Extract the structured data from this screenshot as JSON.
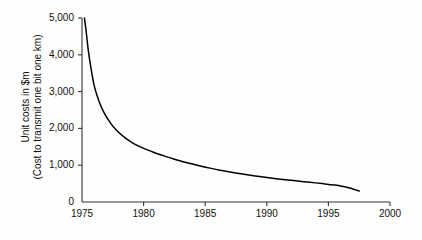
{
  "chart_data": {
    "type": "line",
    "title": "",
    "subtitle": "",
    "xlabel": "",
    "ylabel_lines": [
      "Unit costs in $m",
      "(Cost to transmit one bit one km)"
    ],
    "xlim": [
      1975,
      2000
    ],
    "ylim": [
      0,
      5000
    ],
    "xticks": [
      1975,
      1980,
      1985,
      1990,
      1995,
      2000
    ],
    "xtick_labels": [
      "1975",
      "1980",
      "1985",
      "1990",
      "1995",
      "2000"
    ],
    "yticks": [
      0,
      1000,
      2000,
      3000,
      4000,
      5000
    ],
    "ytick_labels": [
      "0",
      "1,000",
      "2,000",
      "3,000",
      "4,000",
      "5,000"
    ],
    "grid": false,
    "legend": false,
    "line_color": "#000000",
    "axis_color": "#333333",
    "background_color": "#fefefe",
    "series": [
      {
        "name": "Unit cost to transmit one bit one km",
        "x": [
          1975.2,
          1975.35,
          1975.5,
          1975.7,
          1976.0,
          1976.4,
          1976.8,
          1977.3,
          1977.8,
          1978.4,
          1979.0,
          1979.6,
          1980.2,
          1980.9,
          1981.6,
          1982.3,
          1983.0,
          1983.8,
          1984.6,
          1985.4,
          1986.2,
          1987.0,
          1987.9,
          1988.8,
          1989.7,
          1990.6,
          1991.5,
          1992.5,
          1993.5,
          1994.5,
          1995.5,
          1996.5,
          1997.5
        ],
        "values": [
          5000,
          4600,
          4150,
          3700,
          3150,
          2720,
          2420,
          2150,
          1950,
          1770,
          1630,
          1520,
          1430,
          1340,
          1260,
          1185,
          1115,
          1045,
          980,
          920,
          865,
          815,
          765,
          720,
          680,
          640,
          605,
          570,
          535,
          500,
          460,
          400,
          300
        ]
      }
    ],
    "annotations": []
  }
}
